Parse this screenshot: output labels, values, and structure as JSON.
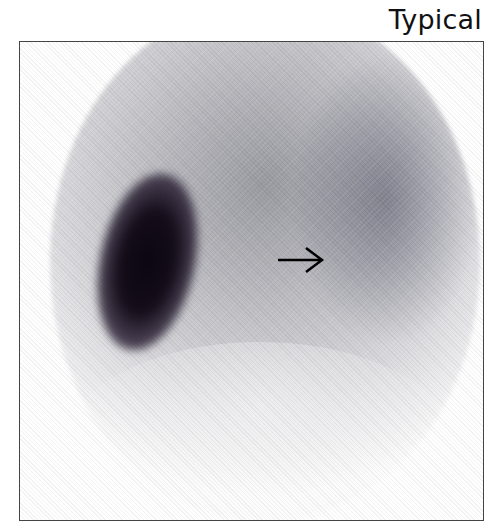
{
  "label": "Typical",
  "image": {
    "type": "nuclear-scintigraphy",
    "annotation": "arrow-right",
    "colors": {
      "frame": "#444444",
      "hotspot": "#0a0610",
      "background": "#ffffff"
    }
  }
}
